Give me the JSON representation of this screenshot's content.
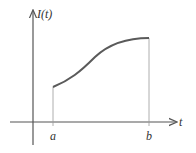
{
  "diagram": {
    "y_label": "I(t)",
    "x_label": "t",
    "points": {
      "a": "a",
      "b": "b"
    },
    "colors": {
      "curve": "#5a5a5a",
      "axis": "#555555",
      "guide": "#999999"
    }
  }
}
